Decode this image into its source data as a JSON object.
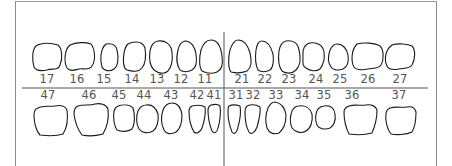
{
  "colors": {
    "outline": "#1a1a1a",
    "frame": "#8a8a8a",
    "divider": "#555555",
    "label": "#555555",
    "background": "#ffffff"
  },
  "upper_teeth": [
    {
      "number": "17",
      "x": 47
    },
    {
      "number": "16",
      "x": 77
    },
    {
      "number": "15",
      "x": 104
    },
    {
      "number": "14",
      "x": 132
    },
    {
      "number": "13",
      "x": 157
    },
    {
      "number": "12",
      "x": 181
    },
    {
      "number": "11",
      "x": 205
    },
    {
      "number": "21",
      "x": 242
    },
    {
      "number": "22",
      "x": 265
    },
    {
      "number": "23",
      "x": 289
    },
    {
      "number": "24",
      "x": 316
    },
    {
      "number": "25",
      "x": 340
    },
    {
      "number": "26",
      "x": 368
    },
    {
      "number": "27",
      "x": 400
    }
  ],
  "lower_teeth": [
    {
      "number": "47",
      "x": 48
    },
    {
      "number": "46",
      "x": 89
    },
    {
      "number": "45",
      "x": 119
    },
    {
      "number": "44",
      "x": 144
    },
    {
      "number": "43",
      "x": 171
    },
    {
      "number": "42",
      "x": 197
    },
    {
      "number": "41",
      "x": 214
    },
    {
      "number": "31",
      "x": 236
    },
    {
      "number": "32",
      "x": 253
    },
    {
      "number": "33",
      "x": 276
    },
    {
      "number": "34",
      "x": 302
    },
    {
      "number": "35",
      "x": 324
    },
    {
      "number": "36",
      "x": 352
    },
    {
      "number": "37",
      "x": 399
    }
  ]
}
